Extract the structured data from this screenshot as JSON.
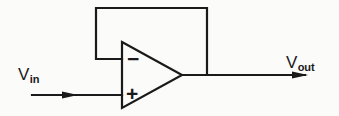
{
  "figure": {
    "name": "unity-gain-voltage-follower-op-amp",
    "background_color": "#fbfbfa",
    "stroke_color": "#1a1a1a"
  },
  "labels": {
    "input": {
      "base": "V",
      "sub": "in"
    },
    "output": {
      "base": "V",
      "sub": "out"
    }
  },
  "terminals": {
    "inverting": "−",
    "noninverting": "+"
  },
  "geometry": {
    "triangle": {
      "x_left": 122,
      "y_top": 42,
      "y_bottom": 108,
      "x_apex": 182,
      "y_apex": 75
    },
    "input_wire": {
      "x_start": 32,
      "x_end": 122,
      "y": 95,
      "arrow_x": 76
    },
    "output_wire": {
      "x_start": 182,
      "x_end": 307,
      "y": 75,
      "arrow_x": 307
    },
    "feedback_wire": {
      "x_left": 96,
      "y_top": 8,
      "x_right": 207,
      "y_inverting": 59,
      "y_output": 75
    }
  }
}
